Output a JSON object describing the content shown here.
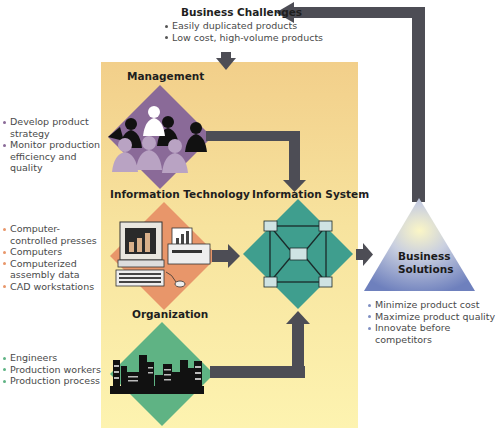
{
  "business_challenges": {
    "title": "Business Challenges",
    "items": [
      "Easily duplicated products",
      "Low cost, high-volume products"
    ]
  },
  "management": {
    "title": "Management",
    "items": [
      "Develop product strategy",
      "Monitor production efficiency and quality"
    ],
    "color": "#8a6a98"
  },
  "information_technology": {
    "title": "Information Technology",
    "items": [
      "Computer-controlled presses",
      "Computers",
      "Computerized assembly data",
      "CAD workstations"
    ],
    "color": "#e8966a"
  },
  "organization": {
    "title": "Organization",
    "items": [
      "Engineers",
      "Production workers",
      "Production process"
    ],
    "color": "#5fb384"
  },
  "information_system": {
    "title": "Information System",
    "color": "#3f9e8e"
  },
  "business_solutions": {
    "title_line1": "Business",
    "title_line2": "Solutions",
    "items": [
      "Minimize product cost",
      "Maximize product quality",
      "Innovate before competitors"
    ],
    "color": "#7f8fc2"
  },
  "colors": {
    "arrow": "#4d4d55",
    "panel_top": "#f2cf8a",
    "panel_bottom": "#fdf3b0"
  }
}
